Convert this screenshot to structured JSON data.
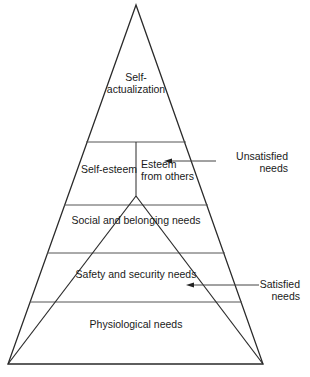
{
  "diagram": {
    "levels": [
      {
        "id": "self-actualization",
        "line1": "Self-",
        "line2": "actualization"
      },
      {
        "id": "esteem",
        "left": "Self-esteem",
        "right_line1": "Esteem",
        "right_line2": "from others"
      },
      {
        "id": "social",
        "label": "Social and belonging needs"
      },
      {
        "id": "safety",
        "label": "Safety and security needs"
      },
      {
        "id": "physiological",
        "label": "Physiological needs"
      }
    ],
    "annotations": {
      "unsatisfied": {
        "line1": "Unsatisfied",
        "line2": "needs"
      },
      "satisfied": {
        "line1": "Satisfied",
        "line2": "needs"
      }
    },
    "colors": {
      "line": "#2a2a2a",
      "divider": "#555555",
      "text": "#1a1a1a",
      "background": "#ffffff"
    }
  }
}
